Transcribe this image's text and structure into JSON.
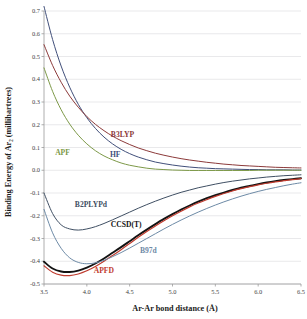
{
  "chart_data": {
    "type": "line",
    "title": "",
    "xlabel": "Ar-Ar bond distance (Å)",
    "ylabel": "Binding Energy of Ar₂  (millihartrees)",
    "xlim": [
      3.5,
      6.5
    ],
    "ylim": [
      -0.5,
      0.7
    ],
    "grid": true,
    "legend_position": "inline-annotations",
    "xticks": [
      "3.5",
      "4.0",
      "4.5",
      "5.0",
      "5.5",
      "6.0",
      "6.5"
    ],
    "xtick_values": [
      3.5,
      4.0,
      4.5,
      5.0,
      5.5,
      6.0,
      6.5
    ],
    "yticks": [
      "-0.5",
      "-0.4",
      "-0.3",
      "-0.2",
      "-0.1",
      "0.0",
      "0.1",
      "0.2",
      "0.3",
      "0.4",
      "0.5",
      "0.6",
      "0.7"
    ],
    "ytick_values": [
      -0.5,
      -0.4,
      -0.3,
      -0.2,
      -0.1,
      0.0,
      0.1,
      0.2,
      0.3,
      0.4,
      0.5,
      0.6,
      0.7
    ],
    "x": [
      3.5,
      3.6,
      3.7,
      3.8,
      3.9,
      4.0,
      4.1,
      4.2,
      4.3,
      4.4,
      4.5,
      4.6,
      4.7,
      4.8,
      4.9,
      5.0,
      5.1,
      5.2,
      5.3,
      5.4,
      5.5,
      5.6,
      5.7,
      5.8,
      5.9,
      6.0,
      6.1,
      6.2,
      6.3,
      6.4,
      6.5
    ],
    "series": [
      {
        "name": "HF",
        "color": "#414f7a",
        "width": 1.0,
        "label_x": 4.27,
        "label_y": 0.058,
        "values": [
          0.72,
          0.575,
          0.458,
          0.365,
          0.29,
          0.231,
          0.184,
          0.146,
          0.116,
          0.092,
          0.073,
          0.058,
          0.046,
          0.036,
          0.029,
          0.023,
          0.018,
          0.014,
          0.011,
          0.009,
          0.007,
          0.006,
          0.005,
          0.004,
          0.003,
          0.003,
          0.002,
          0.002,
          0.002,
          0.001,
          0.001
        ]
      },
      {
        "name": "B3LYP",
        "color": "#8c3a3a",
        "width": 1.0,
        "label_x": 4.28,
        "label_y": 0.148,
        "values": [
          0.552,
          0.461,
          0.387,
          0.326,
          0.277,
          0.236,
          0.202,
          0.174,
          0.15,
          0.13,
          0.113,
          0.098,
          0.086,
          0.075,
          0.066,
          0.058,
          0.051,
          0.045,
          0.04,
          0.035,
          0.031,
          0.027,
          0.024,
          0.021,
          0.019,
          0.017,
          0.015,
          0.013,
          0.012,
          0.011,
          0.01
        ]
      },
      {
        "name": "APF",
        "color": "#7d9948",
        "width": 1.0,
        "label_x": 3.63,
        "label_y": 0.068,
        "values": [
          0.45,
          0.347,
          0.266,
          0.203,
          0.154,
          0.116,
          0.086,
          0.063,
          0.046,
          0.032,
          0.022,
          0.015,
          0.009,
          0.005,
          0.003,
          0.001,
          0.0,
          -0.001,
          -0.001,
          -0.001,
          -0.001,
          -0.001,
          -0.001,
          -0.001,
          -0.001,
          0.0,
          0.0,
          0.0,
          0.0,
          0.0,
          0.0
        ]
      },
      {
        "name": "B2PLYPd",
        "color": "#3f4f63",
        "width": 1.0,
        "label_x": 3.86,
        "label_y": -0.162,
        "values": [
          -0.1,
          -0.19,
          -0.24,
          -0.258,
          -0.263,
          -0.258,
          -0.248,
          -0.234,
          -0.218,
          -0.201,
          -0.184,
          -0.167,
          -0.151,
          -0.136,
          -0.122,
          -0.109,
          -0.097,
          -0.087,
          -0.077,
          -0.069,
          -0.061,
          -0.054,
          -0.048,
          -0.043,
          -0.038,
          -0.034,
          -0.03,
          -0.027,
          -0.024,
          -0.022,
          -0.02
        ]
      },
      {
        "name": "CCSD(T)",
        "color": "#131313",
        "width": 1.9,
        "label_x": 4.28,
        "label_y": -0.248,
        "values": [
          -0.402,
          -0.432,
          -0.445,
          -0.447,
          -0.441,
          -0.428,
          -0.41,
          -0.388,
          -0.363,
          -0.338,
          -0.312,
          -0.286,
          -0.261,
          -0.237,
          -0.214,
          -0.193,
          -0.173,
          -0.155,
          -0.138,
          -0.123,
          -0.11,
          -0.098,
          -0.087,
          -0.077,
          -0.069,
          -0.061,
          -0.054,
          -0.048,
          -0.043,
          -0.039,
          -0.035
        ]
      },
      {
        "name": "APFD",
        "color": "#bf3b2e",
        "width": 1.2,
        "label_x": 4.08,
        "label_y": -0.452,
        "values": [
          -0.42,
          -0.448,
          -0.461,
          -0.463,
          -0.456,
          -0.442,
          -0.423,
          -0.4,
          -0.375,
          -0.349,
          -0.322,
          -0.295,
          -0.269,
          -0.245,
          -0.222,
          -0.2,
          -0.18,
          -0.161,
          -0.144,
          -0.129,
          -0.115,
          -0.102,
          -0.091,
          -0.081,
          -0.072,
          -0.064,
          -0.057,
          -0.051,
          -0.046,
          -0.041,
          -0.037
        ]
      },
      {
        "name": "B97d",
        "color": "#6d8aa6",
        "width": 1.0,
        "label_x": 4.62,
        "label_y": -0.362,
        "values": [
          -0.172,
          -0.275,
          -0.343,
          -0.385,
          -0.405,
          -0.411,
          -0.407,
          -0.396,
          -0.38,
          -0.362,
          -0.342,
          -0.321,
          -0.3,
          -0.279,
          -0.258,
          -0.238,
          -0.219,
          -0.201,
          -0.184,
          -0.168,
          -0.153,
          -0.139,
          -0.126,
          -0.114,
          -0.103,
          -0.093,
          -0.084,
          -0.076,
          -0.068,
          -0.061,
          -0.055
        ]
      }
    ]
  }
}
